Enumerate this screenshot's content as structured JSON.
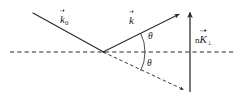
{
  "figure": {
    "name": "wave-vector-scattering-diagram",
    "background_color": "#ffffff",
    "stroke_color": "#2b2b2b",
    "labels": {
      "incident_vector": {
        "base": "k",
        "subscript": "0",
        "overline": "vector-arrow",
        "full_text": "k⃗0"
      },
      "scattered_vector": {
        "base": "k",
        "subscript": "",
        "overline": "vector-arrow",
        "full_text": "k⃗"
      },
      "reciprocal_vector": {
        "prefix": "n",
        "base": "K",
        "subscript": "⊥",
        "overline": "vector-arrow",
        "full_text": "nK⃗⊥"
      },
      "angle_upper": "θ",
      "angle_lower": "θ"
    },
    "geometry": {
      "vertex": {
        "x": 103,
        "y": 52
      },
      "axis_dashed_horizontal": {
        "x1": 10,
        "y1": 52,
        "x2": 236,
        "y2": 52
      },
      "incident_ray": {
        "x1": 33,
        "y1": 13,
        "x2": 103,
        "y2": 52,
        "style": "solid"
      },
      "scattered_ray": {
        "x1": 103,
        "y1": 52,
        "x2": 181,
        "y2": 13,
        "style": "solid",
        "arrowhead": "end"
      },
      "mirror_ray": {
        "x1": 103,
        "y1": 52,
        "x2": 186,
        "y2": 91,
        "style": "dashed",
        "arrowhead": "end"
      },
      "vertical_vector": {
        "x1": 190,
        "y1": 92,
        "x2": 190,
        "y2": 10,
        "style": "solid",
        "arrowhead": "end"
      },
      "angle_arc": {
        "cx": 103,
        "cy": 52,
        "radius": 42,
        "start_deg": 26.5,
        "end_deg": -26.5
      }
    },
    "icons": {
      "arrowhead": "arrowhead-icon",
      "vector-overline": "vector-arrow-icon"
    }
  }
}
